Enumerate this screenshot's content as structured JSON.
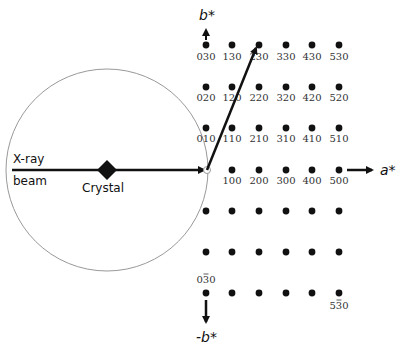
{
  "diagram": {
    "colors": {
      "ink": "#111111",
      "circle": "#999999",
      "index_text": "#333333"
    },
    "ewald_circle": {
      "cx": 107,
      "cy": 170,
      "r": 101
    },
    "origin": {
      "x": 207,
      "y": 170
    },
    "labels": {
      "xray_line1": "X-ray",
      "xray_line2": "beam",
      "crystal": "Crystal",
      "a_star": "a*",
      "b_star": "b*",
      "neg_b_star": "-b*"
    },
    "grid": {
      "columns_x": [
        206,
        232,
        259,
        286,
        312,
        339
      ],
      "rows_y": [
        45,
        87,
        128,
        170,
        211,
        252,
        293
      ]
    },
    "indices": [
      {
        "text": "030",
        "x": 206,
        "y": 60
      },
      {
        "text": "130",
        "x": 232,
        "y": 60
      },
      {
        "text": "230",
        "x": 259,
        "y": 60
      },
      {
        "text": "330",
        "x": 286,
        "y": 60
      },
      {
        "text": "430",
        "x": 312,
        "y": 60
      },
      {
        "text": "530",
        "x": 339,
        "y": 60
      },
      {
        "text": "020",
        "x": 206,
        "y": 101
      },
      {
        "text": "120",
        "x": 232,
        "y": 101
      },
      {
        "text": "220",
        "x": 259,
        "y": 101
      },
      {
        "text": "320",
        "x": 286,
        "y": 101
      },
      {
        "text": "420",
        "x": 312,
        "y": 101
      },
      {
        "text": "520",
        "x": 339,
        "y": 101
      },
      {
        "text": "010",
        "x": 206,
        "y": 142
      },
      {
        "text": "110",
        "x": 232,
        "y": 142
      },
      {
        "text": "210",
        "x": 259,
        "y": 142
      },
      {
        "text": "310",
        "x": 286,
        "y": 142
      },
      {
        "text": "410",
        "x": 312,
        "y": 142
      },
      {
        "text": "510",
        "x": 339,
        "y": 142
      },
      {
        "text": "100",
        "x": 232,
        "y": 184
      },
      {
        "text": "200",
        "x": 259,
        "y": 184
      },
      {
        "text": "300",
        "x": 286,
        "y": 184
      },
      {
        "text": "400",
        "x": 312,
        "y": 184
      },
      {
        "text": "500",
        "x": 339,
        "y": 184
      }
    ],
    "neg_indices": [
      {
        "text": "030",
        "bar_char": 1,
        "x": 206,
        "y": 283
      },
      {
        "text": "530",
        "bar_char": 1,
        "x": 339,
        "y": 309
      }
    ]
  }
}
